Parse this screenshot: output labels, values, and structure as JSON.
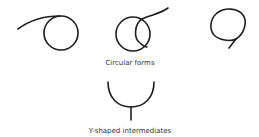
{
  "diagram": {
    "groups": [
      {
        "label": "Circular forms",
        "shapes": [
          "circle-with-tangent-tail",
          "overlapping-double-loop",
          "circle-with-downward-tail"
        ]
      },
      {
        "label": "Y-shaped intermediates",
        "shapes": [
          "u-curve-with-stem"
        ]
      }
    ],
    "colors": {
      "stroke": "#1e1e1e",
      "text": "#333333",
      "background": "#ffffff"
    }
  }
}
